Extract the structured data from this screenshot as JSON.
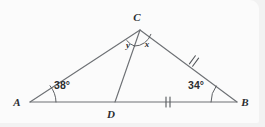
{
  "figure": {
    "name": "triangle-with-cevian",
    "background_color": "#fbfbfb",
    "line_color": "#6e7175",
    "label_color": "#2b2d30"
  },
  "vertices": [
    {
      "id": "A",
      "label": "A",
      "x": 30,
      "y": 102
    },
    {
      "id": "B",
      "label": "B",
      "x": 237,
      "y": 102
    },
    {
      "id": "C",
      "label": "C",
      "x": 140,
      "y": 30
    },
    {
      "id": "D",
      "label": "D",
      "x": 115,
      "y": 102
    }
  ],
  "vertex_label_positions": [
    {
      "id": "A",
      "label": "A",
      "x": 17,
      "y": 106
    },
    {
      "id": "B",
      "label": "B",
      "x": 245,
      "y": 106
    },
    {
      "id": "C",
      "label": "C",
      "x": 137,
      "y": 21
    },
    {
      "id": "D",
      "label": "D",
      "x": 111,
      "y": 118
    }
  ],
  "segments": [
    {
      "name": "side-AB",
      "from": "A",
      "to": "B"
    },
    {
      "name": "side-AC",
      "from": "A",
      "to": "C"
    },
    {
      "name": "side-CB",
      "from": "C",
      "to": "B"
    },
    {
      "name": "cevian-CD",
      "from": "C",
      "to": "D"
    }
  ],
  "angles": [
    {
      "name": "angle-at-A",
      "vertex": "A",
      "label": "38°",
      "label_x": 62,
      "label_y": 86,
      "arc_radius": 26
    },
    {
      "name": "angle-at-B",
      "vertex": "B",
      "label": "34°",
      "label_x": 196,
      "label_y": 86,
      "arc_radius": 26
    },
    {
      "name": "angle-y-at-C",
      "vertex": "C",
      "label": "y",
      "label_x": 129,
      "label_y": 47,
      "arc_radius": 17
    },
    {
      "name": "angle-x-at-C",
      "vertex": "C",
      "label": "x",
      "label_x": 148,
      "label_y": 47,
      "arc_radius": 17
    }
  ],
  "tick_marks": [
    {
      "name": "tick-segment-DB",
      "on_segment": "DB",
      "count": 2,
      "center_x": 168,
      "center_y": 102
    },
    {
      "name": "tick-segment-CB",
      "on_segment": "CB",
      "count": 2,
      "center_x": 194,
      "center_y": 61
    }
  ]
}
